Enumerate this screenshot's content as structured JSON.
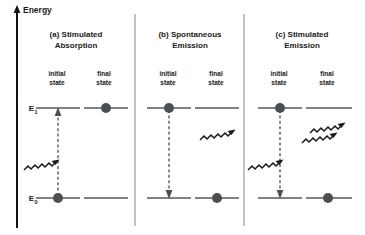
{
  "figure": {
    "axis": {
      "label": "Energy",
      "arrow_direction": "up"
    },
    "energy_levels": [
      {
        "id": "E1",
        "symbol": "E",
        "subscript": "1"
      },
      {
        "id": "E0",
        "symbol": "E",
        "subscript": "0"
      }
    ],
    "state_labels": {
      "initial": "initial\nstate",
      "initial_line1": "initial",
      "initial_line2": "state",
      "final_line1": "final",
      "final_line2": "state"
    },
    "panels": [
      {
        "id": "panel-a",
        "title_line1": "(a) Stimulated",
        "title_line2": "Absorption",
        "initial_electron_level": "E0",
        "final_electron_level": "E1",
        "transition_direction": "up",
        "incoming_photons": 1,
        "outgoing_photons": 0,
        "photon_side": "initial"
      },
      {
        "id": "panel-b",
        "title_line1": "(b) Spontaneous",
        "title_line2": "Emission",
        "initial_electron_level": "E1",
        "final_electron_level": "E0",
        "transition_direction": "down",
        "incoming_photons": 0,
        "outgoing_photons": 1,
        "photon_side": "final"
      },
      {
        "id": "panel-c",
        "title_line1": "(c) Stimulated",
        "title_line2": "Emission",
        "initial_electron_level": "E1",
        "final_electron_level": "E0",
        "transition_direction": "down",
        "incoming_photons": 1,
        "outgoing_photons": 2,
        "photon_side": "both"
      }
    ],
    "colors": {
      "background": "#ffffff",
      "axis": "#121212",
      "level_line": "#555a5e",
      "divider": "#8b9095",
      "electron": "#4a4f54",
      "photon": "#1a1a1a",
      "transition": "#4a4f54",
      "text": "#1a1a1a"
    }
  }
}
